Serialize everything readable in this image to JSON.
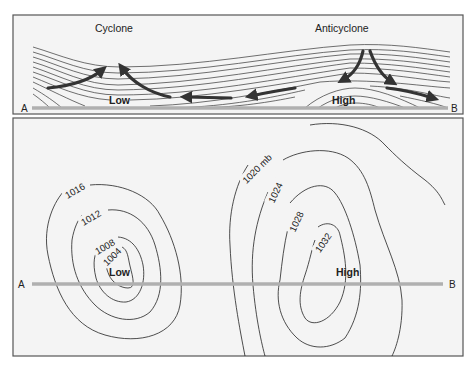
{
  "cross_section": {
    "left_title": "Cyclone",
    "right_title": "Anticyclone",
    "low_label": "Low",
    "high_label": "High",
    "point_a": "A",
    "point_b": "B"
  },
  "map_view": {
    "low_label": "Low",
    "high_label": "High",
    "point_a": "A",
    "point_b": "B",
    "low_isobars": [
      "1016",
      "1012",
      "1008",
      "1004"
    ],
    "high_isobars": [
      "1020 mb",
      "1024",
      "1028",
      "1032"
    ]
  },
  "colors": {
    "background": "#f4f4f4",
    "border": "#555555",
    "line": "#222222",
    "arrow": "#333333",
    "section_line": "#b0b0b0"
  }
}
